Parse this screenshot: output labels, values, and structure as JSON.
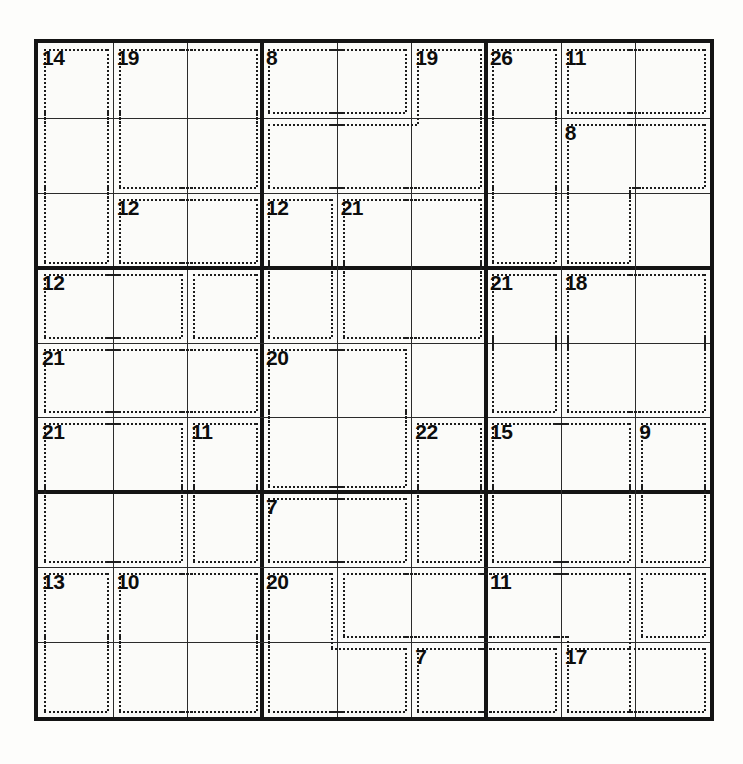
{
  "puzzle": {
    "type": "killer-sudoku",
    "title": "Killer Sudoku",
    "grid_size": 9,
    "box_size": 3,
    "background_color": "#fdfdfb",
    "line_color": "#2b2b2b",
    "thick_line_color": "#141414",
    "cage_border_color": "#1c1c1c",
    "cage_border_style": "dotted",
    "sum_text_color": "#0d0d0d",
    "givens": []
  },
  "geometry": {
    "grid_left": 38,
    "grid_top": 43,
    "grid_width": 672,
    "grid_height": 674,
    "cell_width": 74.67,
    "cell_height": 74.89,
    "outer_border_px": 4,
    "block_border_px": 4,
    "thin_line_px": 1
  },
  "cages": [
    {
      "sum": "14",
      "anchor": [
        0,
        0
      ],
      "cells": [
        [
          0,
          0
        ],
        [
          1,
          0
        ],
        [
          2,
          0
        ]
      ]
    },
    {
      "sum": "19",
      "anchor": [
        0,
        1
      ],
      "cells": [
        [
          0,
          1
        ],
        [
          0,
          2
        ],
        [
          1,
          1
        ],
        [
          1,
          2
        ]
      ]
    },
    {
      "sum": "8",
      "anchor": [
        0,
        3
      ],
      "cells": [
        [
          0,
          3
        ],
        [
          0,
          4
        ]
      ]
    },
    {
      "sum": "19",
      "anchor": [
        0,
        5
      ],
      "cells": [
        [
          0,
          5
        ],
        [
          1,
          3
        ],
        [
          1,
          4
        ],
        [
          1,
          5
        ]
      ]
    },
    {
      "sum": "26",
      "anchor": [
        0,
        6
      ],
      "cells": [
        [
          0,
          6
        ],
        [
          1,
          6
        ],
        [
          2,
          6
        ],
        [
          3,
          2
        ]
      ]
    },
    {
      "sum": "11",
      "anchor": [
        0,
        7
      ],
      "cells": [
        [
          0,
          7
        ],
        [
          0,
          8
        ]
      ]
    },
    {
      "sum": "8",
      "anchor": [
        1,
        7
      ],
      "cells": [
        [
          1,
          7
        ],
        [
          1,
          8
        ],
        [
          2,
          7
        ]
      ]
    },
    {
      "sum": "12",
      "anchor": [
        2,
        1
      ],
      "cells": [
        [
          2,
          1
        ],
        [
          2,
          2
        ]
      ]
    },
    {
      "sum": "12",
      "anchor": [
        2,
        3
      ],
      "cells": [
        [
          2,
          3
        ],
        [
          3,
          3
        ]
      ]
    },
    {
      "sum": "21",
      "anchor": [
        2,
        4
      ],
      "cells": [
        [
          2,
          4
        ],
        [
          2,
          5
        ],
        [
          3,
          4
        ],
        [
          3,
          5
        ]
      ]
    },
    {
      "sum": "12",
      "anchor": [
        3,
        0
      ],
      "cells": [
        [
          3,
          0
        ],
        [
          3,
          1
        ]
      ]
    },
    {
      "sum": "21",
      "anchor": [
        3,
        6
      ],
      "cells": [
        [
          3,
          6
        ],
        [
          4,
          6
        ]
      ]
    },
    {
      "sum": "18",
      "anchor": [
        3,
        7
      ],
      "cells": [
        [
          3,
          7
        ],
        [
          3,
          8
        ],
        [
          4,
          7
        ],
        [
          4,
          8
        ]
      ]
    },
    {
      "sum": "21",
      "anchor": [
        4,
        0
      ],
      "cells": [
        [
          4,
          0
        ],
        [
          4,
          1
        ],
        [
          4,
          2
        ]
      ]
    },
    {
      "sum": "20",
      "anchor": [
        4,
        3
      ],
      "cells": [
        [
          4,
          3
        ],
        [
          4,
          4
        ],
        [
          5,
          3
        ],
        [
          5,
          4
        ]
      ]
    },
    {
      "sum": "21",
      "anchor": [
        5,
        0
      ],
      "cells": [
        [
          5,
          0
        ],
        [
          5,
          1
        ],
        [
          6,
          0
        ],
        [
          6,
          1
        ]
      ]
    },
    {
      "sum": "11",
      "anchor": [
        5,
        2
      ],
      "cells": [
        [
          5,
          2
        ],
        [
          6,
          2
        ]
      ]
    },
    {
      "sum": "22",
      "anchor": [
        5,
        5
      ],
      "cells": [
        [
          5,
          5
        ],
        [
          6,
          5
        ]
      ]
    },
    {
      "sum": "15",
      "anchor": [
        5,
        6
      ],
      "cells": [
        [
          5,
          6
        ],
        [
          5,
          7
        ],
        [
          6,
          6
        ],
        [
          6,
          7
        ]
      ]
    },
    {
      "sum": "9",
      "anchor": [
        5,
        8
      ],
      "cells": [
        [
          5,
          8
        ],
        [
          6,
          8
        ]
      ]
    },
    {
      "sum": "7",
      "anchor": [
        6,
        3
      ],
      "cells": [
        [
          6,
          3
        ],
        [
          6,
          4
        ]
      ]
    },
    {
      "sum": "13",
      "anchor": [
        7,
        0
      ],
      "cells": [
        [
          7,
          0
        ],
        [
          8,
          0
        ]
      ]
    },
    {
      "sum": "10",
      "anchor": [
        7,
        1
      ],
      "cells": [
        [
          7,
          1
        ],
        [
          7,
          2
        ],
        [
          8,
          1
        ],
        [
          8,
          2
        ]
      ]
    },
    {
      "sum": "20",
      "anchor": [
        7,
        3
      ],
      "cells": [
        [
          7,
          3
        ],
        [
          8,
          3
        ],
        [
          8,
          4
        ]
      ]
    },
    {
      "sum": "11",
      "anchor": [
        7,
        6
      ],
      "cells": [
        [
          7,
          4
        ],
        [
          7,
          5
        ],
        [
          7,
          6
        ],
        [
          7,
          7
        ],
        [
          8,
          7
        ],
        [
          8,
          8
        ]
      ]
    },
    {
      "sum": "7",
      "anchor": [
        8,
        5
      ],
      "cells": [
        [
          8,
          5
        ],
        [
          8,
          6
        ]
      ]
    },
    {
      "sum": "17",
      "anchor": [
        8,
        7
      ],
      "cells": [
        [
          7,
          8
        ],
        [
          8,
          7
        ]
      ]
    }
  ],
  "cage_sums_list": [
    "14",
    "19",
    "8",
    "19",
    "26",
    "11",
    "8",
    "12",
    "12",
    "21",
    "12",
    "21",
    "18",
    "21",
    "20",
    "21",
    "11",
    "22",
    "15",
    "9",
    "7",
    "13",
    "10",
    "20",
    "11",
    "7",
    "17"
  ]
}
